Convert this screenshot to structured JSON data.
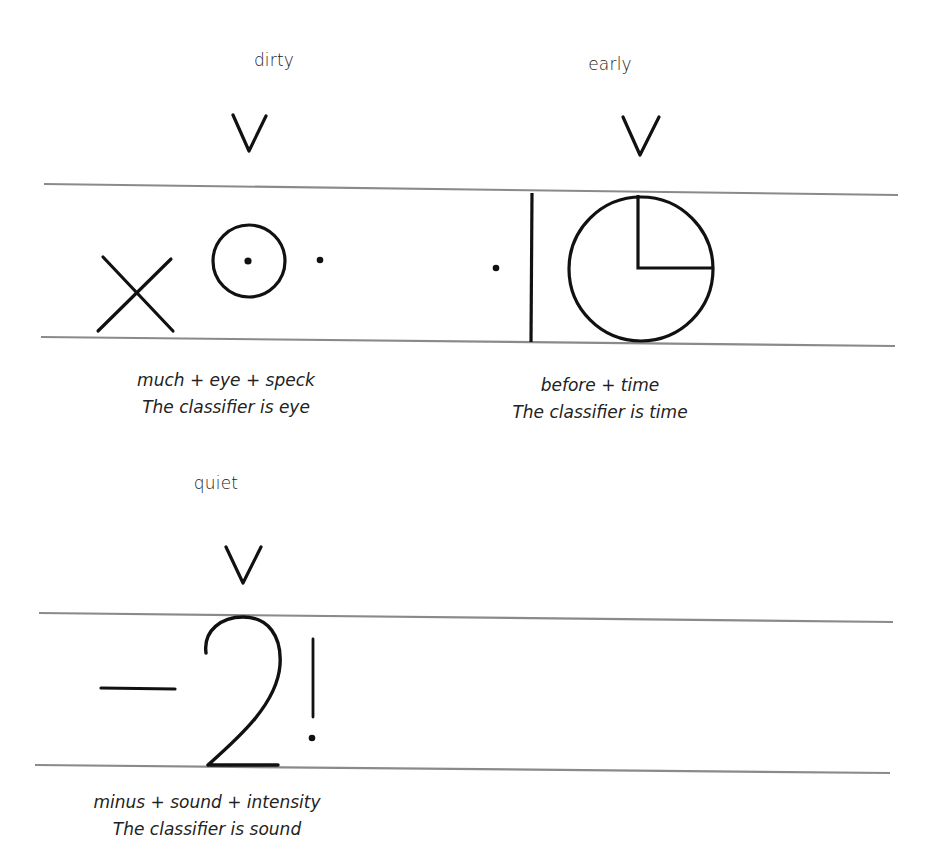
{
  "diagrams": [
    {
      "word": "dirty",
      "components": [
        "much",
        "eye",
        "speck"
      ],
      "formula": "much + eye + speck",
      "classifier_note": "The classifier is eye",
      "symbols": [
        "x-mark",
        "circle-with-dot",
        "dot"
      ]
    },
    {
      "word": "early",
      "components": [
        "before",
        "time"
      ],
      "formula": "before + time",
      "classifier_note": "The classifier is time",
      "symbols": [
        "dot",
        "vertical-bar",
        "clock-circle"
      ]
    },
    {
      "word": "quiet",
      "components": [
        "minus",
        "sound",
        "intensity"
      ],
      "formula": "minus + sound + intensity",
      "classifier_note": "The classifier is sound",
      "symbols": [
        "minus-bar",
        "ear-shape-2",
        "exclamation"
      ]
    }
  ],
  "marker": "V",
  "colors": {
    "ink": "#111111",
    "guide_line": "#8a8a8a",
    "background": "#ffffff"
  }
}
